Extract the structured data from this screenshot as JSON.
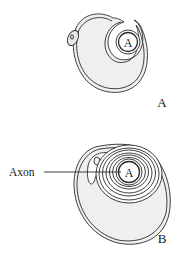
{
  "diagram": {
    "panels": [
      {
        "id": "A",
        "panel_label": "A",
        "axon_label": "A"
      },
      {
        "id": "B",
        "panel_label": "B",
        "axon_label": "A",
        "callout": "Axon"
      }
    ],
    "colors": {
      "stroke": "#2a2a2a",
      "cytoplasm_fill": "#efefef",
      "background": "#ffffff"
    }
  }
}
